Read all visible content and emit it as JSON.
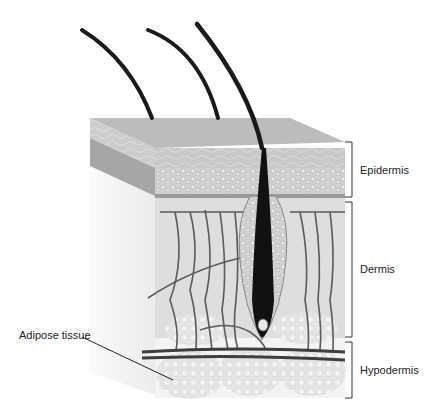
{
  "diagram": {
    "labels": {
      "epidermis": "Epidermis",
      "dermis": "Dermis",
      "hypodermis": "Hypodermis",
      "adipose": "Adipose tissue"
    },
    "colors": {
      "hair": "#1a1a1a",
      "surface_top": "#bdbdbd",
      "surface_side": "#9a9a9a",
      "epidermis_cells": "#c9c9c9",
      "dermis": "#dcdcdc",
      "vessels": "#555555",
      "adipose": "#e6e6e6",
      "bracket": "#333333"
    }
  }
}
